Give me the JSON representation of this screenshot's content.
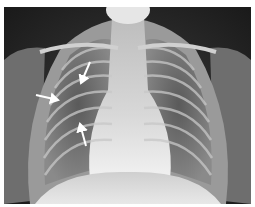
{
  "image": {
    "subject": "Frontal chest radiograph",
    "view": "PA",
    "annotations": [
      {
        "type": "arrow",
        "color": "#ffffff",
        "from": [
          90,
          62
        ],
        "to": [
          80,
          85
        ]
      },
      {
        "type": "arrow",
        "color": "#ffffff",
        "from": [
          36,
          95
        ],
        "to": [
          60,
          100
        ]
      },
      {
        "type": "arrow",
        "color": "#ffffff",
        "from": [
          86,
          146
        ],
        "to": [
          79,
          122
        ]
      }
    ]
  }
}
